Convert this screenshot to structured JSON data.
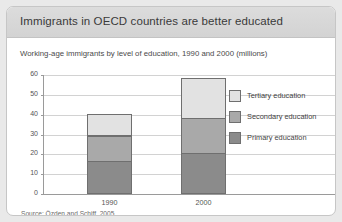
{
  "card": {
    "title": "Immigrants in OECD countries are better educated",
    "subtitle": "Working-age immigrants by level of education, 1990 and 2000 (millions)",
    "source": "Source: Özden and Schiff, 2005"
  },
  "legend": {
    "items": [
      {
        "label": "Tertiary education",
        "color": "#e2e2e2"
      },
      {
        "label": "Secondary education",
        "color": "#a9a9a9"
      },
      {
        "label": "Primary education",
        "color": "#8b8b8b"
      }
    ]
  },
  "axis": {
    "yticks": [
      "0",
      "10",
      "20",
      "30",
      "40",
      "50",
      "60"
    ]
  },
  "chart_data": {
    "type": "bar",
    "stacked": true,
    "title": "Immigrants in OECD countries are better educated",
    "subtitle": "Working-age immigrants by level of education, 1990 and 2000 (millions)",
    "xlabel": "",
    "ylabel": "",
    "ylim": [
      0,
      60
    ],
    "ytick_step": 10,
    "grid": true,
    "legend_position": "right",
    "categories": [
      "1990",
      "2000"
    ],
    "series": [
      {
        "name": "Primary education",
        "values": [
          16,
          20
        ],
        "color": "#8b8b8b"
      },
      {
        "name": "Secondary education",
        "values": [
          13,
          18
        ],
        "color": "#a9a9a9"
      },
      {
        "name": "Tertiary education",
        "values": [
          11,
          20
        ],
        "color": "#e2e2e2"
      }
    ],
    "totals": [
      40,
      58
    ],
    "units": "millions",
    "source": "Source: Özden and Schiff, 2005"
  }
}
